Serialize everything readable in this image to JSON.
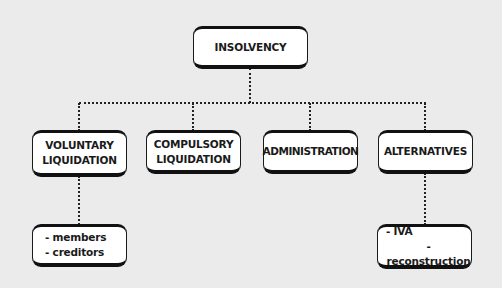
{
  "diagram": {
    "root": {
      "label": "INSOLVENCY"
    },
    "children": [
      {
        "label_lines": [
          "VOLUNTARY",
          "LIQUIDATION"
        ],
        "details": [
          "- members",
          "- creditors"
        ]
      },
      {
        "label_lines": [
          "COMPULSORY",
          "LIQUIDATION"
        ]
      },
      {
        "label_lines": [
          "ADMINISTRATION"
        ]
      },
      {
        "label_lines": [
          "ALTERNATIVES"
        ],
        "details": [
          "- IVA",
          "- reconstruction"
        ]
      }
    ]
  },
  "colors": {
    "background": "#ebebeb",
    "box_fill": "#ffffff",
    "border": "#111111"
  }
}
